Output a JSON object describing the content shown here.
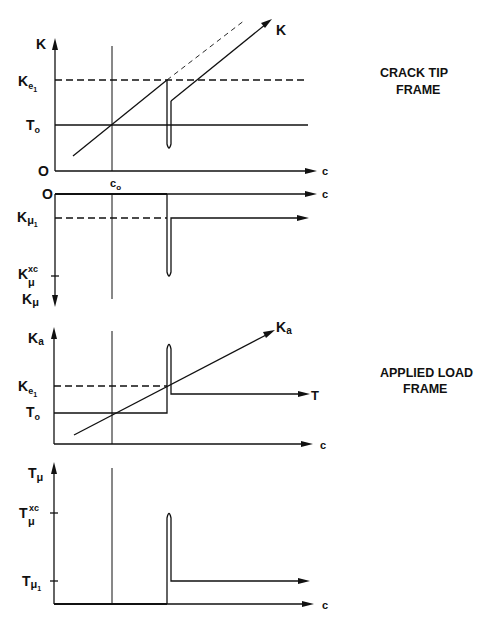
{
  "figure": {
    "frames": {
      "crack_tip": {
        "line1": "CRACK TIP",
        "line2": "FRAME"
      },
      "applied_load": {
        "line1": "APPLIED LOAD",
        "line2": "FRAME"
      }
    },
    "panel1": {
      "y_axis_label": "K",
      "curve_label": "K",
      "x_axis_label": "c",
      "origin_label": "O",
      "c0_label": "c",
      "c0_sub": "o",
      "ticks": [
        {
          "main": "K",
          "sub": "e",
          "sub2": "1"
        },
        {
          "main": "T",
          "sub": "o"
        }
      ]
    },
    "panel2": {
      "origin_label": "O",
      "x_axis_label": "c",
      "y_axis_label_main": "K",
      "y_axis_label_sub": "μ",
      "ticks": [
        {
          "main": "K",
          "sub": "μ",
          "sub2": "1"
        },
        {
          "main": "K",
          "sub": "μ",
          "sup": "xc"
        }
      ]
    },
    "panel3": {
      "y_axis_label_main": "K",
      "y_axis_label_sub": "a",
      "curve_label_main": "K",
      "curve_label_sub": "a",
      "plateau_label": "T",
      "x_axis_label": "c",
      "ticks": [
        {
          "main": "K",
          "sub": "e",
          "sub2": "1"
        },
        {
          "main": "T",
          "sub": "o"
        }
      ]
    },
    "panel4": {
      "y_axis_label_main": "T",
      "y_axis_label_sub": "μ",
      "x_axis_label": "c",
      "ticks": [
        {
          "main": "T",
          "sub": "μ",
          "sup": "xc"
        },
        {
          "main": "T",
          "sub": "μ",
          "sub2": "1"
        }
      ]
    }
  }
}
